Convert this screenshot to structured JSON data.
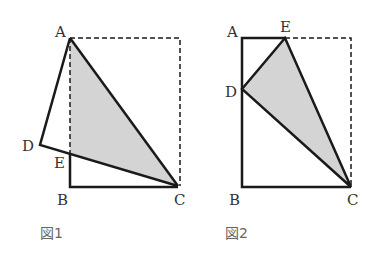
{
  "colors": {
    "stroke": "#1a1a1a",
    "fill": "#d4d4d4",
    "label": "#333333",
    "caption": "#666666"
  },
  "figure1": {
    "caption": "図1",
    "points": {
      "A": {
        "label": "A",
        "x": 70,
        "y": 38
      },
      "B": {
        "label": "B",
        "x": 70,
        "y": 187
      },
      "C": {
        "label": "C",
        "x": 178,
        "y": 186
      },
      "D": {
        "label": "D",
        "x": 40,
        "y": 145
      },
      "E": {
        "label": "E",
        "x": 70,
        "y": 154
      },
      "TR": {
        "x": 180,
        "y": 38
      }
    },
    "shaded": "triangle ACE (folded region)",
    "dashed": "original rectangle outline A-TR-C"
  },
  "figure2": {
    "caption": "図2",
    "points": {
      "A": {
        "label": "A",
        "x": 242,
        "y": 38
      },
      "B": {
        "label": "B",
        "x": 242,
        "y": 187
      },
      "C": {
        "label": "C",
        "x": 351,
        "y": 187
      },
      "D": {
        "label": "D",
        "x": 242,
        "y": 89
      },
      "E": {
        "label": "E",
        "x": 285,
        "y": 38
      },
      "TR": {
        "x": 351,
        "y": 38
      }
    },
    "shaded": "triangle DEC",
    "dashed": "original rectangle outline E-TR-C"
  }
}
